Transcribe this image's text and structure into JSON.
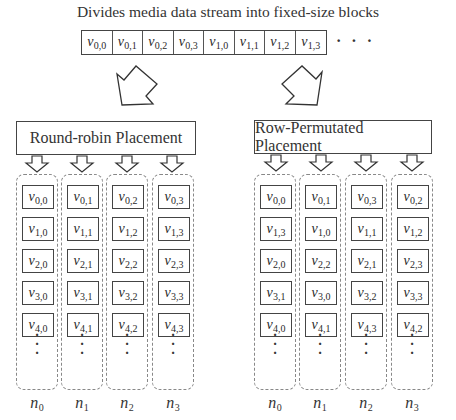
{
  "title": "Divides media data stream into fixed-size blocks",
  "stream": {
    "blocks": [
      {
        "base": "v",
        "sub": "0,0"
      },
      {
        "base": "v",
        "sub": "0,1"
      },
      {
        "base": "v",
        "sub": "0,2"
      },
      {
        "base": "v",
        "sub": "0,3"
      },
      {
        "base": "v",
        "sub": "1,0"
      },
      {
        "base": "v",
        "sub": "1,1"
      },
      {
        "base": "v",
        "sub": "1,2"
      },
      {
        "base": "v",
        "sub": "1,3"
      }
    ],
    "ellipsis": "· · ·"
  },
  "left": {
    "label": "Round-robin Placement",
    "columns": [
      {
        "node": "n",
        "node_sub": "0",
        "blocks": [
          "0,0",
          "1,0",
          "2,0",
          "3,0",
          "4,0"
        ]
      },
      {
        "node": "n",
        "node_sub": "1",
        "blocks": [
          "0,1",
          "1,1",
          "2,1",
          "3,1",
          "4,1"
        ]
      },
      {
        "node": "n",
        "node_sub": "2",
        "blocks": [
          "0,2",
          "1,2",
          "2,2",
          "3,2",
          "4,2"
        ]
      },
      {
        "node": "n",
        "node_sub": "3",
        "blocks": [
          "0,3",
          "1,3",
          "2,3",
          "3,3",
          "4,3"
        ]
      }
    ]
  },
  "right": {
    "label": "Row-Permutated Placement",
    "columns": [
      {
        "node": "n",
        "node_sub": "0",
        "blocks": [
          "0,0",
          "1,3",
          "2,0",
          "3,1",
          "4,0"
        ]
      },
      {
        "node": "n",
        "node_sub": "1",
        "blocks": [
          "0,1",
          "1,0",
          "2,2",
          "3,0",
          "4,1"
        ]
      },
      {
        "node": "n",
        "node_sub": "2",
        "blocks": [
          "0,3",
          "1,1",
          "2,1",
          "3,2",
          "4,3"
        ]
      },
      {
        "node": "n",
        "node_sub": "3",
        "blocks": [
          "0,2",
          "1,2",
          "2,3",
          "3,3",
          "4,2"
        ]
      }
    ]
  },
  "block_base": "v",
  "vertical_dots": "·\n·\n·",
  "colors": {
    "stroke": "#444444",
    "dashed": "#888888",
    "text": "#333333"
  }
}
